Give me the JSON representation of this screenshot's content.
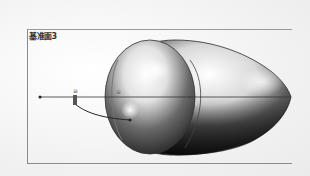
{
  "viewport": {
    "plane_label": "基准面3",
    "colors": {
      "background": "#f6f6f6",
      "frame_border": "#8a8a8a",
      "model_dark": "#1e1e1e",
      "model_light": "#ffffff",
      "sketch_line": "#333333"
    }
  },
  "sketch": {
    "dimension_marker_left": "≡",
    "dimension_marker_center": "≡"
  }
}
